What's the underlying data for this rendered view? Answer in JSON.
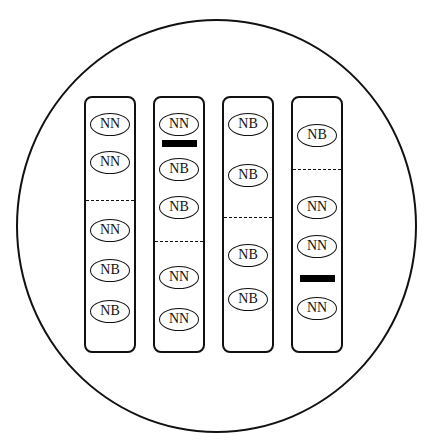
{
  "diagram": {
    "type": "chromosome-lane-comparison",
    "lanes": [
      {
        "id": "lane-1",
        "left": 84,
        "items": [
          {
            "kind": "oval",
            "label": "NN",
            "y": 122
          },
          {
            "kind": "oval",
            "label": "NN",
            "y": 160
          },
          {
            "kind": "dash",
            "y": 198
          },
          {
            "kind": "oval",
            "label": "NN",
            "y": 228
          },
          {
            "kind": "oval",
            "label": "NB",
            "y": 268
          },
          {
            "kind": "oval",
            "label": "NB",
            "y": 309
          }
        ]
      },
      {
        "id": "lane-2",
        "left": 153,
        "items": [
          {
            "kind": "oval",
            "label": "NN",
            "y": 122
          },
          {
            "kind": "bar",
            "y": 141
          },
          {
            "kind": "oval",
            "label": "NB",
            "y": 167
          },
          {
            "kind": "oval",
            "label": "NB",
            "y": 205
          },
          {
            "kind": "dash",
            "y": 239
          },
          {
            "kind": "oval",
            "label": "NN",
            "y": 275
          },
          {
            "kind": "oval",
            "label": "NN",
            "y": 317
          }
        ]
      },
      {
        "id": "lane-3",
        "left": 222,
        "items": [
          {
            "kind": "oval",
            "label": "NB",
            "y": 122
          },
          {
            "kind": "oval",
            "label": "NB",
            "y": 173
          },
          {
            "kind": "dash",
            "y": 215
          },
          {
            "kind": "oval",
            "label": "NB",
            "y": 253
          },
          {
            "kind": "oval",
            "label": "NB",
            "y": 297
          }
        ]
      },
      {
        "id": "lane-4",
        "left": 291,
        "items": [
          {
            "kind": "oval",
            "label": "NB",
            "y": 133
          },
          {
            "kind": "dash",
            "y": 167
          },
          {
            "kind": "oval",
            "label": "NN",
            "y": 205
          },
          {
            "kind": "oval",
            "label": "NN",
            "y": 244
          },
          {
            "kind": "bar",
            "y": 276
          },
          {
            "kind": "oval",
            "label": "NN",
            "y": 306
          }
        ]
      }
    ]
  }
}
